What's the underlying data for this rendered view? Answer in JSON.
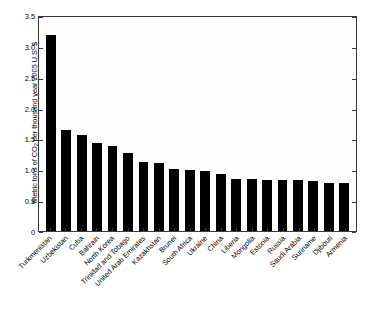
{
  "chart_data": {
    "type": "bar",
    "title": "",
    "subtitle": "",
    "xlabel": "",
    "ylabel": "Metric tons of CO2 per thousand year 2005 U.S. $",
    "ylabel_parts": {
      "pre": "Metric tons of CO",
      "sub": "2",
      "post": " per thousand year 2005 U.S. $"
    },
    "ylim": [
      0,
      3.5
    ],
    "yticks": [
      "0",
      "0.5",
      "1.0",
      "1.5",
      "2.0",
      "2.5",
      "3.0",
      "3.5"
    ],
    "ytick_values": [
      0,
      0.5,
      1.0,
      1.5,
      2.0,
      2.5,
      3.0,
      3.5
    ],
    "grid": false,
    "legend": "none",
    "bar_color": "#000000",
    "categories": [
      "Turkmenistan",
      "Uzbekistan",
      "Cuba",
      "Bahrain",
      "North Korea",
      "Trinidad and Tobago",
      "United Arab Emirates",
      "Kazakhstan",
      "Brunei",
      "South Africa",
      "Ukraine",
      "China",
      "Liberia",
      "Mongolia",
      "Estonia",
      "Russia",
      "Saudi Arabia",
      "Suriname",
      "Djibouti",
      "Armenia"
    ],
    "values": [
      3.18,
      1.63,
      1.56,
      1.43,
      1.37,
      1.26,
      1.12,
      1.11,
      1.0,
      0.99,
      0.97,
      0.93,
      0.84,
      0.84,
      0.82,
      0.82,
      0.82,
      0.81,
      0.78,
      0.78
    ]
  }
}
